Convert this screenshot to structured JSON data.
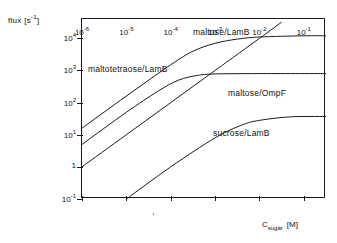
{
  "chart_data": {
    "type": "line",
    "title": "",
    "xlabel": "C_sugar [M]",
    "ylabel": "flux [s^-1]",
    "xlabel_base": "C",
    "xlabel_sub": "sugar",
    "xlabel_unit": "[M]",
    "ylabel_text": "flux [s",
    "ylabel_exp": "-1",
    "ylabel_tail": "]",
    "xscale": "log",
    "yscale": "log",
    "xlim": [
      1e-06,
      0.316
    ],
    "ylim": [
      0.1,
      40000
    ],
    "grid": false,
    "legend": "inline-labels",
    "xticks": [
      {
        "value": 1e-06,
        "mantissa": "10",
        "exponent": "-6"
      },
      {
        "value": 1e-05,
        "mantissa": "10",
        "exponent": "-5"
      },
      {
        "value": 0.0001,
        "mantissa": "10",
        "exponent": "-4"
      },
      {
        "value": 0.001,
        "mantissa": "10",
        "exponent": "-3"
      },
      {
        "value": 0.01,
        "mantissa": "10",
        "exponent": "-2"
      },
      {
        "value": 0.1,
        "mantissa": "10",
        "exponent": "-1"
      }
    ],
    "yticks": [
      {
        "value": 10000,
        "mantissa": "10",
        "exponent": "4"
      },
      {
        "value": 1000,
        "mantissa": "10",
        "exponent": "3"
      },
      {
        "value": 100,
        "mantissa": "10",
        "exponent": "2"
      },
      {
        "value": 10,
        "mantissa": "10",
        "exponent": "1"
      },
      {
        "value": 1,
        "mantissa": "1",
        "exponent": ""
      },
      {
        "value": 0.1,
        "mantissa": "10",
        "exponent": "-1"
      }
    ],
    "series": [
      {
        "name": "maltose/LamB",
        "label": "maltose/LamB",
        "saturating": true,
        "plateau": 12000,
        "points": [
          {
            "x": 1e-06,
            "y": 16
          },
          {
            "x": 1e-05,
            "y": 160
          },
          {
            "x": 0.0001,
            "y": 1500
          },
          {
            "x": 0.00032,
            "y": 4000
          },
          {
            "x": 0.001,
            "y": 7000
          },
          {
            "x": 0.0032,
            "y": 9500
          },
          {
            "x": 0.01,
            "y": 11000
          },
          {
            "x": 0.1,
            "y": 12000
          },
          {
            "x": 0.316,
            "y": 12000
          }
        ]
      },
      {
        "name": "maltotetraose/LamB",
        "label": "maltotetraose/LamB",
        "saturating": true,
        "plateau": 800,
        "points": [
          {
            "x": 1e-06,
            "y": 5.0
          },
          {
            "x": 1e-05,
            "y": 50
          },
          {
            "x": 5e-05,
            "y": 220
          },
          {
            "x": 0.00015,
            "y": 500
          },
          {
            "x": 0.0004,
            "y": 700
          },
          {
            "x": 0.001,
            "y": 780
          },
          {
            "x": 0.01,
            "y": 800
          },
          {
            "x": 0.316,
            "y": 800
          }
        ]
      },
      {
        "name": "maltose/OmpF",
        "label": "maltose/OmpF",
        "saturating": false,
        "plateau": null,
        "points": [
          {
            "x": 1e-06,
            "y": 1.0
          },
          {
            "x": 1e-05,
            "y": 10
          },
          {
            "x": 0.0001,
            "y": 100
          },
          {
            "x": 0.001,
            "y": 1000
          },
          {
            "x": 0.01,
            "y": 10000
          },
          {
            "x": 0.0316,
            "y": 32000
          }
        ]
      },
      {
        "name": "sucrose/LamB",
        "label": "sucrose/LamB",
        "saturating": true,
        "plateau": 37,
        "points": [
          {
            "x": 1e-05,
            "y": 0.1
          },
          {
            "x": 0.0001,
            "y": 1.0
          },
          {
            "x": 0.001,
            "y": 8.0
          },
          {
            "x": 0.004,
            "y": 20
          },
          {
            "x": 0.01,
            "y": 28
          },
          {
            "x": 0.05,
            "y": 36
          },
          {
            "x": 0.316,
            "y": 37
          }
        ]
      }
    ],
    "annotations": [
      {
        "text": "maltose/LamB",
        "x_px": 193,
        "y_px": 27
      },
      {
        "text": "maltotetraose/LamB",
        "x_px": 88,
        "y_px": 64
      },
      {
        "text": "maltose/OmpF",
        "x_px": 228,
        "y_px": 88
      },
      {
        "text": "sucrose/LamB",
        "x_px": 213,
        "y_px": 128
      }
    ],
    "colors": {
      "curve": "#1a1a1a",
      "frame": "#1a1a1a",
      "background": "#ffffff"
    }
  }
}
